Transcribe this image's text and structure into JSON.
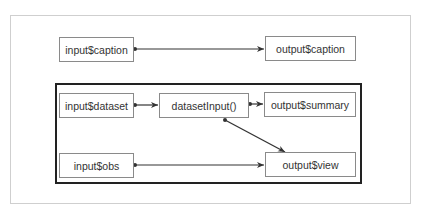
{
  "diagram": {
    "nodes": {
      "input_caption": "input$caption",
      "output_caption": "output$caption",
      "input_dataset": "input$dataset",
      "dataset_input": "datasetInput()",
      "output_summary": "output$summary",
      "input_obs": "input$obs",
      "output_view": "output$view"
    },
    "edges": [
      {
        "from": "input$caption",
        "to": "output$caption"
      },
      {
        "from": "input$dataset",
        "to": "datasetInput()"
      },
      {
        "from": "datasetInput()",
        "to": "output$summary"
      },
      {
        "from": "datasetInput()",
        "to": "output$view"
      },
      {
        "from": "input$obs",
        "to": "output$view"
      }
    ],
    "colors": {
      "frame": "#cfcfcf",
      "group_border": "#222222",
      "node_border": "#8a8a8a",
      "edge": "#333333"
    }
  }
}
